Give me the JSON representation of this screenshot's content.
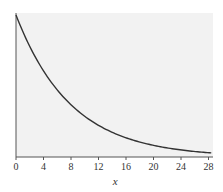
{
  "chart_data": {
    "type": "line",
    "title": "",
    "xlabel": "x",
    "ylabel": "",
    "xlim": [
      0,
      28.6
    ],
    "ylim": [
      0,
      1.0
    ],
    "grid": false,
    "legend": null,
    "x_ticks": [
      0,
      4,
      8,
      12,
      16,
      20,
      24,
      28
    ],
    "y_ticks": [],
    "series": [
      {
        "name": "decay curve",
        "x": [
          0,
          2,
          4,
          6,
          8,
          10,
          12,
          14,
          16,
          18,
          20,
          22,
          24,
          26,
          28
        ],
        "values": [
          1.0,
          0.78,
          0.61,
          0.47,
          0.37,
          0.29,
          0.22,
          0.17,
          0.14,
          0.11,
          0.08,
          0.06,
          0.05,
          0.04,
          0.03
        ]
      }
    ]
  },
  "colors": {
    "plot_background": "#f2f2f2",
    "curve": "#333333",
    "axis": "#555555",
    "text": "#333333"
  }
}
